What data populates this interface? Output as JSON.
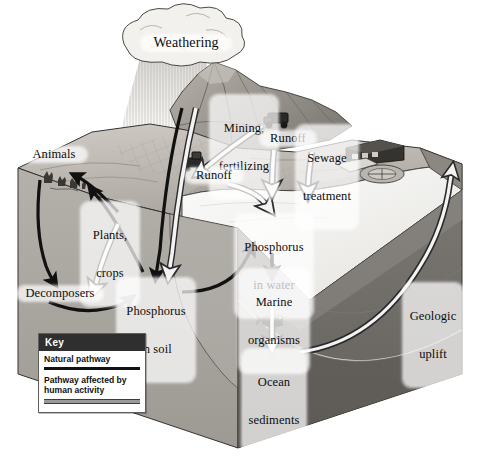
{
  "figure": {
    "type": "cycle-diagram",
    "background": "#ffffff"
  },
  "labels": {
    "weathering": "Weathering",
    "mining_fertilizing": "Mining,\nfertilizing",
    "runoff_upper": "Runoff",
    "runoff_lower": "Runoff",
    "sewage_treatment": "Sewage\ntreatment",
    "animals": "Animals",
    "plants_crops": "Plants,\ncrops",
    "decomposers": "Decomposers",
    "phosphorus_in_soil": "Phosphorus\nin soil",
    "phosphorus_in_water": "Phosphorus\nin water",
    "marine_organisms": "Marine\norganisms",
    "ocean_sediments": "Ocean\nsediments",
    "geologic_uplift": "Geologic\nuplift"
  },
  "key": {
    "title": "Key",
    "natural": "Natural pathway",
    "human_line1": "Pathway affected",
    "human_line2": "by human activity"
  },
  "colors": {
    "natural_pathway": "#111111",
    "human_pathway": "#f2f2f2",
    "human_pathway_outline": "#2b2b2b",
    "key_header_bg": "#2f2f2f",
    "key_header_text": "#ffffff",
    "land_surface": "#b9b5ae",
    "land_surface_dark": "#8e8a84",
    "block_face_left": "#a9a6a0",
    "block_face_right": "#6f6c68",
    "ocean_surface": "#f3f2ef",
    "ocean_floor": "#8a8782",
    "mountain": "#9d9992",
    "cloud": "#f0efec",
    "outline": "#2b2b2b"
  },
  "scene_objects": [
    "rain-cloud",
    "mountain",
    "mining-truck",
    "tractor",
    "sewage-treatment-plant",
    "grazing-animals",
    "farm-fields",
    "fish",
    "ocean-water-wedge",
    "bedrock-cross-section"
  ],
  "pathways": [
    {
      "name": "weathering-to-soil",
      "kind": "human",
      "from": "Weathering",
      "to": "Phosphorus in soil"
    },
    {
      "name": "mountain-to-soil",
      "kind": "natural",
      "from": "Weathering",
      "to": "Phosphorus in soil"
    },
    {
      "name": "mining-to-runoff",
      "kind": "human",
      "from": "Mining, fertilizing",
      "to": "Runoff"
    },
    {
      "name": "runoff-to-water",
      "kind": "human",
      "from": "Runoff",
      "to": "Phosphorus in water"
    },
    {
      "name": "sewage-to-water",
      "kind": "human",
      "from": "Sewage treatment",
      "to": "Phosphorus in water"
    },
    {
      "name": "soil-to-plants",
      "kind": "natural",
      "from": "Phosphorus in soil",
      "to": "Plants, crops"
    },
    {
      "name": "plants-to-animals",
      "kind": "natural",
      "from": "Plants, crops",
      "to": "Animals"
    },
    {
      "name": "animals-to-decomposers",
      "kind": "natural",
      "from": "Animals",
      "to": "Decomposers"
    },
    {
      "name": "plants-to-decomposers",
      "kind": "human",
      "from": "Plants, crops",
      "to": "Decomposers"
    },
    {
      "name": "decomposers-to-soil",
      "kind": "natural",
      "from": "Decomposers",
      "to": "Phosphorus in soil"
    },
    {
      "name": "soil-to-water",
      "kind": "natural",
      "from": "Phosphorus in soil",
      "to": "Phosphorus in water"
    },
    {
      "name": "water-to-marine",
      "kind": "natural",
      "from": "Phosphorus in water",
      "to": "Marine organisms"
    },
    {
      "name": "marine-to-sediments",
      "kind": "human",
      "from": "Marine organisms",
      "to": "Ocean sediments"
    },
    {
      "name": "sediments-to-land",
      "kind": "human",
      "from": "Ocean sediments",
      "to": "Geologic uplift"
    }
  ]
}
